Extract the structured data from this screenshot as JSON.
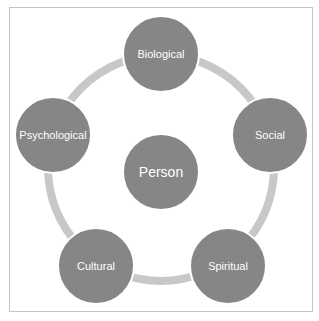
{
  "diagram": {
    "title": "",
    "center": {
      "label": "Person"
    },
    "nodes": [
      {
        "label": "Biological",
        "x": 161,
        "y": 54
      },
      {
        "label": "Social",
        "x": 270,
        "y": 135
      },
      {
        "label": "Spiritual",
        "x": 228,
        "y": 266
      },
      {
        "label": "Cultural",
        "x": 96,
        "y": 266
      },
      {
        "label": "Psychological",
        "x": 53,
        "y": 135
      }
    ],
    "colors": {
      "node": "#868686",
      "ring": "#c8c8c8",
      "frame": "#c4c4c4",
      "text": "#ffffff"
    }
  }
}
